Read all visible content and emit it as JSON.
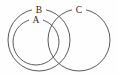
{
  "figure": {
    "kind": "euler-diagram",
    "background_color": "#fefefe",
    "stroke_color": "#5a5a5a",
    "label_color": "#2b2b2b"
  },
  "chart_data": {
    "type": "diagram",
    "title": "",
    "subtitle": "",
    "xlabel": "",
    "ylabel": "",
    "grid": false,
    "legend": "none",
    "sets": [
      {
        "name": "A",
        "label": "A",
        "cx": 36,
        "cy": 42,
        "r": 23,
        "label_x": 36,
        "label_y": 21
      },
      {
        "name": "B",
        "label": "B",
        "cx": 39,
        "cy": 40,
        "r": 31,
        "label_x": 39,
        "label_y": 11
      },
      {
        "name": "C",
        "label": "C",
        "cx": 79,
        "cy": 40,
        "r": 31,
        "label_x": 79,
        "label_y": 11
      }
    ],
    "relations": [
      {
        "subject": "A",
        "relation": "subset-of",
        "object": "B"
      },
      {
        "subject": "B",
        "relation": "overlaps",
        "object": "C"
      },
      {
        "subject": "A",
        "relation": "disjoint-from",
        "object": "C"
      }
    ]
  }
}
